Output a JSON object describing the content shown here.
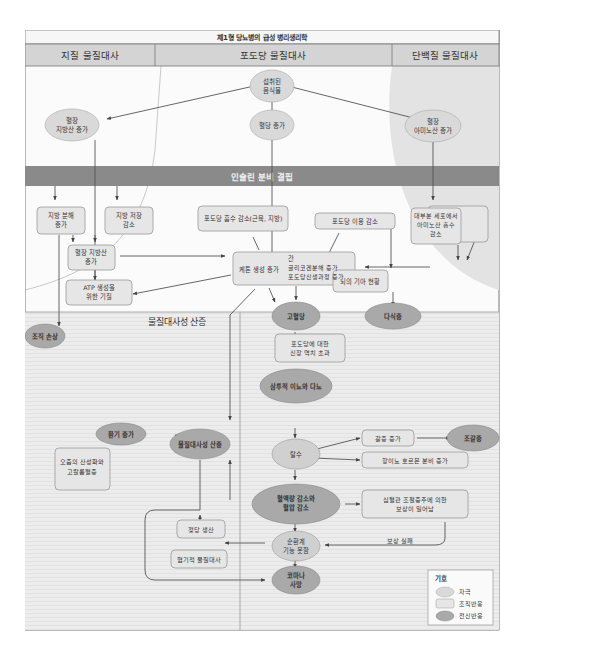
{
  "title": "제1형 당뇨병의 급성 병리생리학",
  "columns": {
    "lipid": "지질 물질대사",
    "glucose": "포도당 물질대사",
    "protein": "단백질 물질대사"
  },
  "banner": "인슐린 분비 결핍",
  "regions": {
    "acidosis": "물질대사성 산증",
    "dehydration": "탈수"
  },
  "colors": {
    "stimulus": "#d9d9d9",
    "tissue": "#e6e6e6",
    "systemic": "#a9a9a9",
    "banner": "#8a8a8a",
    "header": "#d4d4d4"
  },
  "nodes": {
    "food": "섭취된\n음식물",
    "plasma_fa": "혈장\n지방산 증가",
    "blood_glucose": "혈당 증가",
    "plasma_aa": "혈장\n아미노산 증가",
    "lipolysis": "지방 분해\n증가",
    "fat_storage": "지방 저장\n감소",
    "glucose_uptake": "포도당 흡수 감소(근육, 지방)",
    "glucose_use": "포도당 이용 감소",
    "aa_uptake": "대부분 세포에서\n아미노산 흡수\n감소",
    "protein_break": "단백질 분해,\n특히 근육 증가",
    "plasma_fa2": "혈장 지방산\n증가",
    "liver_label": "간",
    "ketone": "케톤 생성 증가",
    "liver": "글리코겐분해 증가\n포도당신생과정 증가",
    "brain": "뇌의 기아 현황",
    "plasma_aa2": "혈장 아미노산\n증가",
    "atp_left": "ATP 생성을\n위한 기질",
    "atp_right": "ATP 생성을\n위한 기질",
    "tissue_loss_left": "조직 손상",
    "tissue_loss_right": "조직 손상",
    "hyperglycemia": "고혈당",
    "hyperphagia": "다식증",
    "renal": "포도당에 대한\n신장 역치 초과",
    "glycosuria": "당뇨",
    "osmotic": "삼투적 이뇨와 다뇨",
    "dehydration": "탈수",
    "thirst": "갈증 증가",
    "polydipsia": "조갈증",
    "adh": "항이뇨 호르몬 분비 증가",
    "volume": "혈액량 감소와\n혈압 감소",
    "compensation": "심혈관 조절중추에 의한\n보상이 일어남",
    "comp_fail": "보상 실패",
    "circ_fail": "순환계\n기능 못함",
    "coma": "코마나\n사망",
    "acidosis": "물질대사성 산증",
    "breath": "환기 증가",
    "acid_urine": "오줌의 산성화와\n고칼륨혈증",
    "lactate": "젖당 생산",
    "anaerobic": "혐기적 물질대사"
  },
  "legend": {
    "title": "기호",
    "items": [
      "자극",
      "조직반응",
      "전신반응"
    ]
  }
}
